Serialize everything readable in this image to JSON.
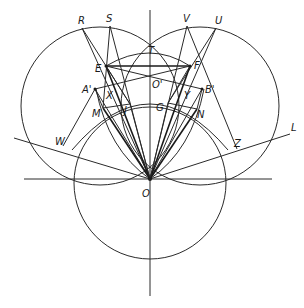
{
  "diagram": {
    "type": "geometric-construction",
    "ink_color": "#1a1a1a",
    "background": "#ffffff",
    "points": {
      "O": {
        "label": "O",
        "x": 150,
        "y": 179,
        "lx": 142,
        "ly": 197
      },
      "O'": {
        "label": "O'",
        "x": 150,
        "y": 84,
        "lx": 152,
        "ly": 88
      },
      "T": {
        "label": "T",
        "x": 150,
        "y": 57,
        "lx": 148,
        "ly": 54
      },
      "R": {
        "label": "R",
        "x": 82,
        "y": 28,
        "lx": 78,
        "ly": 24
      },
      "S": {
        "label": "S",
        "x": 110,
        "y": 26,
        "lx": 106,
        "ly": 22
      },
      "V": {
        "label": "V",
        "x": 187,
        "y": 26,
        "lx": 183,
        "ly": 22
      },
      "U": {
        "label": "U",
        "x": 216,
        "y": 28,
        "lx": 215,
        "ly": 24
      },
      "E": {
        "label": "E",
        "x": 106,
        "y": 66,
        "lx": 95,
        "ly": 72
      },
      "F": {
        "label": "F",
        "x": 190,
        "y": 66,
        "lx": 194,
        "ly": 69
      },
      "A'": {
        "label": "A'",
        "x": 95,
        "y": 89,
        "lx": 82,
        "ly": 93
      },
      "B'": {
        "label": "B'",
        "x": 202,
        "y": 89,
        "lx": 205,
        "ly": 93
      },
      "X": {
        "label": "X",
        "x": 108,
        "y": 91,
        "lx": 106,
        "ly": 99
      },
      "Y": {
        "label": "Y",
        "x": 186,
        "y": 91,
        "lx": 184,
        "ly": 99
      },
      "M": {
        "label": "M",
        "x": 103,
        "y": 108,
        "lx": 92,
        "ly": 117
      },
      "J": {
        "label": "J",
        "x": 130,
        "y": 104,
        "lx": 124,
        "ly": 114
      },
      "G": {
        "label": "G",
        "x": 168,
        "y": 103,
        "lx": 156,
        "ly": 111
      },
      "N": {
        "label": "N",
        "x": 197,
        "y": 109,
        "lx": 197,
        "ly": 118
      },
      "W": {
        "label": "W",
        "x": 63,
        "y": 146,
        "lx": 55,
        "ly": 145
      },
      "Z": {
        "label": "Z",
        "x": 237,
        "y": 149,
        "lx": 234,
        "ly": 147
      },
      "L": {
        "label": "L",
        "x": 290,
        "y": 134,
        "lx": 291,
        "ly": 131
      }
    },
    "circles": [
      {
        "name": "left-circle",
        "cx": 100,
        "cy": 106,
        "r": 79
      },
      {
        "name": "right-circle",
        "cx": 200,
        "cy": 106,
        "r": 79
      },
      {
        "name": "bottom-circle",
        "cx": 150,
        "cy": 183,
        "r": 76
      }
    ],
    "arcs": [
      {
        "name": "top-arc-ET",
        "d": "M 106 66 Q 150 40 190 66"
      },
      {
        "name": "lens-left-O",
        "d": "M 22 110 Q 60 210 150 179"
      },
      {
        "name": "lens-right-O",
        "d": "M 278 110 Q 240 210 150 179"
      },
      {
        "name": "arc-MJGN",
        "d": "M 72 150 Q 150 60 228 150"
      },
      {
        "name": "arc-inner-left",
        "d": "M 96 89 Q 110 150 150 179"
      },
      {
        "name": "arc-inner-right",
        "d": "M 204 89 Q 190 150 150 179"
      }
    ]
  },
  "labels": [
    "R",
    "S",
    "T",
    "V",
    "U",
    "E",
    "F",
    "A'",
    "B'",
    "X",
    "Y",
    "O'",
    "M",
    "J",
    "G",
    "N",
    "W",
    "Z",
    "L",
    "O"
  ]
}
